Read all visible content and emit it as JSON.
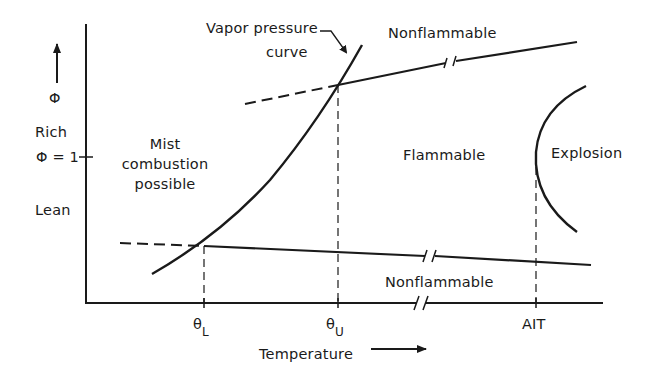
{
  "diagram": {
    "title": "",
    "y_axis": {
      "symbol": "Φ",
      "rich_label": "Rich",
      "lean_label": "Lean",
      "stoich_label": "Φ = 1"
    },
    "x_axis": {
      "label": "Temperature",
      "ticks": [
        {
          "symbol": "θ",
          "subscript": "L"
        },
        {
          "symbol": "θ",
          "subscript": "U"
        },
        {
          "symbol": "AIT",
          "subscript": ""
        }
      ]
    },
    "regions": {
      "nonflammable_upper": "Nonflammable",
      "nonflammable_lower": "Nonflammable",
      "flammable": "Flammable",
      "explosion": "Explosion",
      "mist_line1": "Mist",
      "mist_line2": "combustion",
      "mist_line3": "possible"
    },
    "annotations": {
      "vapor_line1": "Vapor pressure",
      "vapor_line2": "curve"
    },
    "colors": {
      "ink": "#1a1a1a",
      "background": "#ffffff"
    }
  }
}
